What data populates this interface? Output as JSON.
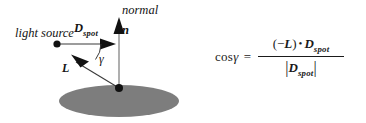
{
  "figure": {
    "background_color": "#ffffff",
    "ink_color": "#1a1a1a",
    "surface_color": "#808080"
  },
  "diagram": {
    "labels": {
      "light_source": "light source",
      "normal": "normal",
      "normal_vector": "n",
      "spot_direction": "D",
      "spot_direction_sub": "spot",
      "light_vector": "L",
      "angle": "γ"
    },
    "icons": {
      "light_source_point": "light-source-dot",
      "surface_point": "surface-point-dot",
      "surface": "gray-ellipse-surface",
      "normal_arrow": "normal-arrow",
      "spot_arrow": "spot-direction-arrow",
      "light_arrow": "light-direction-arrow",
      "angle_arc": "gamma-angle-arc"
    }
  },
  "formula": {
    "lhs_cos": "cos",
    "lhs_angle": "γ",
    "equals": "=",
    "numerator_open": "(",
    "numerator_minus": "−",
    "numerator_L": "L",
    "numerator_close": ")",
    "numerator_dot": "•",
    "numerator_D": "D",
    "numerator_D_sub": "spot",
    "denominator_bar_left": "|",
    "denominator_D": "D",
    "denominator_D_sub": "spot",
    "denominator_bar_right": "|"
  }
}
